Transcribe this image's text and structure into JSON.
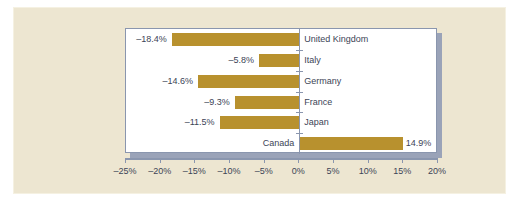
{
  "chart_data": {
    "type": "bar",
    "orientation": "horizontal",
    "title": "",
    "subtitle": "",
    "xlabel": "",
    "ylabel": "",
    "categories": [
      "United Kingdom",
      "Italy",
      "Germany",
      "France",
      "Japan",
      "Canada"
    ],
    "values": [
      -18.4,
      -5.8,
      -14.6,
      -9.3,
      -11.5,
      14.9
    ],
    "value_labels": [
      "–18.4%",
      "–5.8%",
      "–14.6%",
      "–9.3%",
      "–11.5%",
      "14.9%"
    ],
    "xlim": [
      -25,
      20
    ],
    "xtick_values": [
      -25,
      -20,
      -15,
      -10,
      -5,
      0,
      5,
      10,
      15,
      20
    ],
    "xtick_labels": [
      "–25%",
      "–20%",
      "–15%",
      "–10%",
      "–5%",
      "0%",
      "5%",
      "10%",
      "15%",
      "20%"
    ],
    "grid": false,
    "legend": null,
    "bar_color": "#B8912E",
    "plot_background": "#FFFFFF",
    "figure_background": "#EDE6D1",
    "axis_color": "#8A96AE",
    "text_color": "#3C4456"
  }
}
